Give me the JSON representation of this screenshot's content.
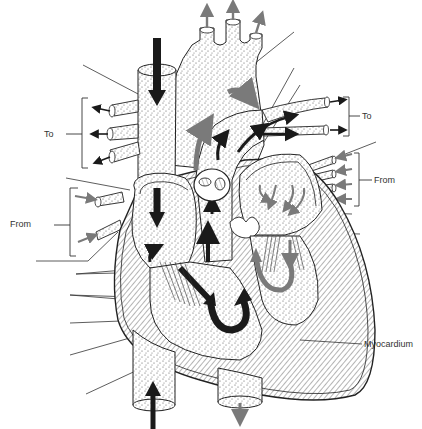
{
  "diagram": {
    "type": "anatomical-heart-cross-section",
    "colors": {
      "outline": "#222222",
      "deoxygenated_arrow": "#1a1a1a",
      "oxygenated_arrow": "#7a7a7a",
      "stipple": "#555555",
      "background": "#ffffff"
    },
    "labels": {
      "left_to": "To",
      "left_from": "From",
      "right_to": "To",
      "right_from": "From",
      "myocardium": "Myocardium"
    },
    "leader_lines": {
      "left_count": 10,
      "right_count": 12,
      "labeled": [
        "Myocardium"
      ],
      "blank": true
    }
  }
}
